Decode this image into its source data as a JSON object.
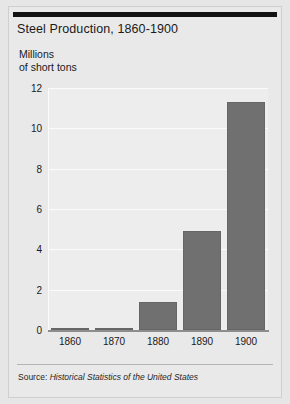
{
  "figure": {
    "title": "Steel Production, 1860-1900",
    "axis_caption_line1": "Millions",
    "axis_caption_line2": "of short tons",
    "source_prefix": "Source:",
    "source_title": "Historical Statistics of the United States",
    "bar_color": "#707070",
    "plot_background": "#ededed",
    "paper_background": "#e9e9e9",
    "gridline_color": "#fbfbfb",
    "rule_color": "#121212"
  },
  "chart_data": {
    "type": "bar",
    "title": "Steel Production, 1860-1900",
    "subtitle": "",
    "xlabel": "",
    "ylabel": "Millions of short tons",
    "categories": [
      "1860",
      "1870",
      "1880",
      "1890",
      "1900"
    ],
    "values": [
      0.01,
      0.08,
      1.4,
      4.9,
      11.3
    ],
    "ylim": [
      0,
      12
    ],
    "yticks": [
      0,
      2,
      4,
      6,
      8,
      10,
      12
    ],
    "ytick_labels": [
      "0",
      "2",
      "4",
      "6",
      "8",
      "10",
      "12"
    ],
    "grid": true,
    "grid_axis": "y",
    "legend": false,
    "legend_position": "none",
    "series": [
      {
        "name": "Steel production",
        "values": [
          0.01,
          0.08,
          1.4,
          4.9,
          11.3
        ]
      }
    ],
    "annotations": [
      "Source: Historical Statistics of the United States"
    ]
  }
}
